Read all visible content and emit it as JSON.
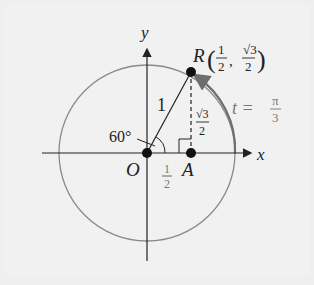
{
  "diagram": {
    "axes": {
      "x_label": "x",
      "y_label": "y"
    },
    "origin_label": "O",
    "point_A_label": "A",
    "point_R_label": "R",
    "R_coord_x_num": "1",
    "R_coord_x_den": "2",
    "R_coord_y_num": "√3",
    "R_coord_y_den": "2",
    "radius_label": "1",
    "angle_label": "60°",
    "OA_num": "1",
    "OA_den": "2",
    "AR_num": "√3",
    "AR_den": "2",
    "arc_label_t": "t =",
    "arc_num": "π",
    "arc_den": "3",
    "colors": {
      "circle": "#8a8a8a",
      "arc": "#6e6e6e",
      "axes": "#222222",
      "background": "#efefef"
    }
  }
}
